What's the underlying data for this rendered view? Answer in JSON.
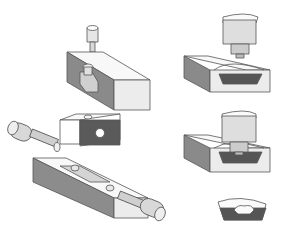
{
  "figure": {
    "colors": {
      "background": "#ffffff",
      "light_face": "#efefef",
      "top_face": "#f8f8f8",
      "mid_face": "#c8c8c8",
      "dark_face": "#808080",
      "darkest": "#555555",
      "outline": "#555555"
    },
    "parts": [
      {
        "id": "punch-and-split-block",
        "position": "top-left"
      },
      {
        "id": "cored-block-with-hole",
        "position": "middle-left"
      },
      {
        "id": "split-die-with-side-cores",
        "position": "bottom-left"
      },
      {
        "id": "cam-punch-over-cavity",
        "position": "top-right"
      },
      {
        "id": "punch-inserted-in-cavity",
        "position": "middle-right"
      },
      {
        "id": "finished-part",
        "position": "bottom-right"
      }
    ]
  }
}
